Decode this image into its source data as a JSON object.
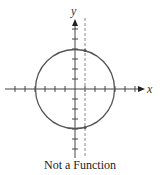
{
  "diagram": {
    "title": "Not a Function",
    "x_axis_label": "x",
    "y_axis_label": "y",
    "colors": {
      "axis": "#444444",
      "circle": "#555555",
      "dashed_line": "#888888",
      "point": "#555555",
      "text": "#222222"
    },
    "circle": {
      "cx": 75,
      "cy": 89,
      "r": 40
    },
    "vertical_line_test": {
      "x": 85,
      "style": "dashed"
    },
    "intersection_points": [
      {
        "x": 85,
        "y": 50
      },
      {
        "x": 85,
        "y": 128
      }
    ]
  }
}
